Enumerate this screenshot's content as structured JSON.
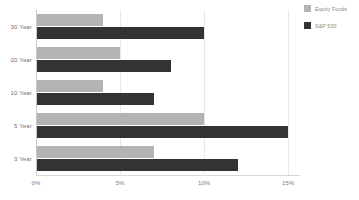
{
  "chart_data": {
    "type": "bar",
    "orientation": "horizontal",
    "title": "",
    "subtitle": "",
    "xlabel": "",
    "ylabel": "",
    "categories": [
      "30 Year",
      "20 Year",
      "10 Year",
      "5 Year",
      "3 Year"
    ],
    "series": [
      {
        "name": "Equity Funds",
        "color": "#b3b3b3",
        "values": [
          4,
          5,
          4,
          10,
          7
        ]
      },
      {
        "name": "S&P 500",
        "color": "#333333",
        "values": [
          10,
          8,
          7,
          15,
          12
        ]
      }
    ],
    "xlim": [
      0,
      15.7
    ],
    "xticks": [
      0,
      5,
      10,
      15
    ],
    "xtick_labels": [
      "0%",
      "5%",
      "10%",
      "15%"
    ],
    "grid": "vertical",
    "legend_position": "top-right",
    "annotations": []
  },
  "legend": {
    "items": [
      {
        "label": "Equity Funds",
        "color": "#b3b3b3"
      },
      {
        "label": "S&P 500",
        "color": "#333333"
      }
    ]
  },
  "colors": {
    "background": "#ffffff",
    "gridline": "#e8e8e8",
    "axis": "#c9c9c9",
    "tick_text": "#7a7a7a",
    "label_text": "#6f6f6f",
    "legend_text": "#888888"
  }
}
